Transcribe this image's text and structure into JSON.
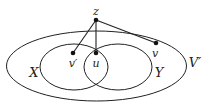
{
  "diagram": {
    "sets": [
      {
        "id": "V_prime",
        "label": "V′"
      },
      {
        "id": "X",
        "label": "X"
      },
      {
        "id": "Y",
        "label": "Y"
      }
    ],
    "nodes": [
      {
        "id": "z",
        "label": "z"
      },
      {
        "id": "v_prime",
        "label": "v′"
      },
      {
        "id": "u",
        "label": "u"
      },
      {
        "id": "v",
        "label": "v"
      }
    ],
    "edges": [
      {
        "from": "z",
        "to": "v_prime"
      },
      {
        "from": "z",
        "to": "u"
      },
      {
        "from": "z",
        "to": "v"
      }
    ]
  }
}
